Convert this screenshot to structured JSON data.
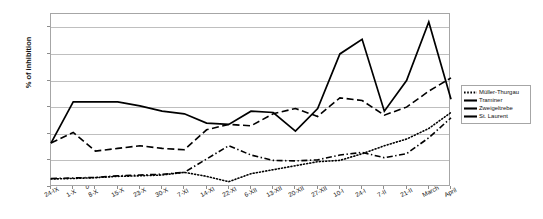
{
  "chart_data": {
    "type": "line",
    "title": "",
    "xlabel": "",
    "ylabel": "% of inhibition",
    "ylim": [
      0,
      65
    ],
    "yticks": [
      0,
      10,
      20,
      30,
      40,
      50,
      60
    ],
    "grid": true,
    "legend_position": "right",
    "categories": [
      "24-IX",
      "1-X",
      "8-X",
      "15-X",
      "23-X",
      "30-X",
      "7-XI",
      "14-XI",
      "22-XI",
      "6-XII",
      "13-XII",
      "20-XII",
      "27-XII",
      "10-I",
      "24-I",
      "7-II",
      "21-II",
      "March",
      "April"
    ],
    "series": [
      {
        "name": "Müller-Thurgau",
        "style": "dotted",
        "color": "#000000",
        "values": [
          3.0,
          3.2,
          3.5,
          4.0,
          4.2,
          4.5,
          5.5,
          4.0,
          2.0,
          5.0,
          6.5,
          8.0,
          9.5,
          10.0,
          12.5,
          15.5,
          18.0,
          22.0,
          28.0
        ]
      },
      {
        "name": "Traminer",
        "style": "dashed",
        "color": "#000000",
        "values": [
          16.5,
          20.5,
          13.5,
          14.5,
          15.5,
          14.5,
          14.0,
          21.5,
          23.5,
          23.0,
          27.5,
          29.5,
          26.5,
          33.5,
          32.5,
          27.0,
          30.0,
          36.0,
          41.0
        ]
      },
      {
        "name": "Zweigeltrebe",
        "style": "dashdot",
        "color": "#000000",
        "values": [
          3.2,
          3.4,
          3.6,
          4.2,
          4.5,
          4.8,
          5.5,
          10.5,
          15.5,
          12.0,
          10.0,
          9.8,
          10.2,
          12.0,
          13.0,
          11.0,
          12.5,
          18.5,
          26.0
        ]
      },
      {
        "name": "St. Laurent",
        "style": "solid",
        "color": "#000000",
        "values": [
          16.5,
          32.0,
          32.0,
          32.0,
          30.5,
          28.5,
          27.5,
          24.0,
          23.5,
          28.5,
          28.0,
          21.0,
          29.5,
          50.0,
          55.5,
          28.5,
          40.0,
          62.0,
          33.0
        ]
      }
    ]
  },
  "legend": {
    "items": [
      {
        "label": "Müller-Thurgau"
      },
      {
        "label": "Traminer"
      },
      {
        "label": "Zweigeltrebe"
      },
      {
        "label": "St. Laurent"
      }
    ]
  }
}
